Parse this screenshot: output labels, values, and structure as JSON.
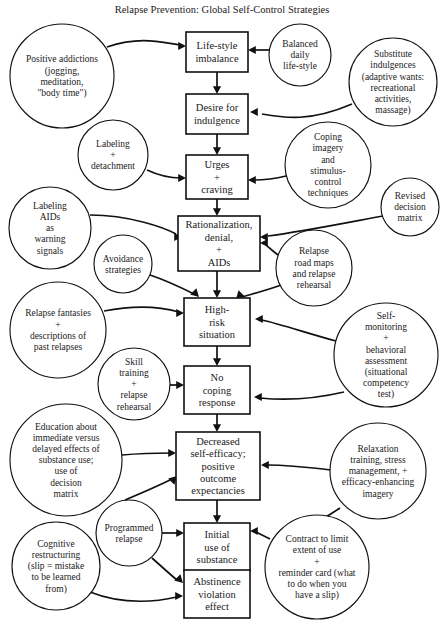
{
  "title": "Relapse Prevention: Global Self-Control Strategies",
  "diagram": {
    "type": "flowchart",
    "canvas": {
      "width": 440,
      "height": 624
    },
    "title_position": {
      "x": 222,
      "y": 13
    },
    "boxes": [
      {
        "id": "lifestyle-imbalance",
        "x": 186,
        "y": 32,
        "w": 62,
        "h": 40,
        "lines": [
          "Life-style",
          "imbalance"
        ],
        "font_size": 10.5
      },
      {
        "id": "desire-for-indulgence",
        "x": 186,
        "y": 94,
        "w": 62,
        "h": 40,
        "lines": [
          "Desire for",
          "indulgence"
        ],
        "font_size": 10.5
      },
      {
        "id": "urges-craving",
        "x": 186,
        "y": 155,
        "w": 62,
        "h": 44,
        "lines": [
          "Urges",
          "+",
          "craving"
        ],
        "font_size": 10.5
      },
      {
        "id": "rationalization-denial-aids",
        "x": 178,
        "y": 216,
        "w": 82,
        "h": 55,
        "lines": [
          "Rationalization,",
          "denial,",
          "+",
          "AIDs"
        ],
        "font_size": 10.5
      },
      {
        "id": "high-risk-situation",
        "x": 184,
        "y": 298,
        "w": 66,
        "h": 48,
        "lines": [
          "High-",
          "risk",
          "situation"
        ],
        "font_size": 10.5
      },
      {
        "id": "no-coping-response",
        "x": 184,
        "y": 366,
        "w": 66,
        "h": 48,
        "lines": [
          "No",
          "coping",
          "response"
        ],
        "font_size": 10.5
      },
      {
        "id": "decreased-self-efficacy",
        "x": 176,
        "y": 432,
        "w": 84,
        "h": 68,
        "lines": [
          "Decreased",
          "self-efficacy;",
          "positive",
          "outcome",
          "expectancies"
        ],
        "font_size": 10.5
      },
      {
        "id": "initial-use-of-substance",
        "x": 184,
        "y": 523,
        "w": 66,
        "h": 48,
        "lines": [
          "Initial",
          "use of",
          "substance"
        ],
        "font_size": 10.5
      },
      {
        "id": "abstinence-violation-effect",
        "x": 184,
        "y": 570,
        "w": 66,
        "h": 48,
        "lines": [
          "Abstinence",
          "violation",
          "effect"
        ],
        "font_size": 10.5
      }
    ],
    "circles": [
      {
        "id": "positive-addictions",
        "cx": 62,
        "cy": 76,
        "r": 52,
        "lines": [
          "Positive addictions",
          "(jogging,",
          "meditation,",
          "\"body time\")"
        ],
        "font_size": 9.5
      },
      {
        "id": "balanced-daily-lifestyle",
        "cx": 300,
        "cy": 55,
        "r": 31,
        "lines": [
          "Balanced",
          "daily",
          "life-style"
        ],
        "font_size": 9.5
      },
      {
        "id": "substitute-indulgences",
        "cx": 393,
        "cy": 82,
        "r": 44,
        "lines": [
          "Substitute",
          "indulgences",
          "(adaptive wants:",
          "recreational",
          "activities,",
          "massage)"
        ],
        "font_size": 9.5
      },
      {
        "id": "labeling-detachment",
        "cx": 113,
        "cy": 155,
        "r": 35,
        "lines": [
          "Labeling",
          "+",
          "detachment"
        ],
        "font_size": 9.5
      },
      {
        "id": "coping-imagery",
        "cx": 328,
        "cy": 165,
        "r": 43,
        "lines": [
          "Coping",
          "imagery",
          "and",
          "stimulus-",
          "control",
          "techniques"
        ],
        "font_size": 9.5
      },
      {
        "id": "revised-decision-matrix",
        "cx": 410,
        "cy": 207,
        "r": 29,
        "lines": [
          "Revised",
          "decision",
          "matrix"
        ],
        "font_size": 9.5
      },
      {
        "id": "labeling-aids-warning-signals",
        "cx": 50,
        "cy": 228,
        "r": 41,
        "lines": [
          "Labeling",
          "AIDs",
          "as",
          "warning",
          "signals"
        ],
        "font_size": 9.5
      },
      {
        "id": "avoidance-strategies",
        "cx": 123,
        "cy": 264,
        "r": 29,
        "lines": [
          "Avoidance",
          "strategies"
        ],
        "font_size": 9.5
      },
      {
        "id": "relapse-road-maps",
        "cx": 314,
        "cy": 268,
        "r": 38,
        "lines": [
          "Relapse",
          "road maps",
          "and relapse",
          "rehearsal"
        ],
        "font_size": 9.5
      },
      {
        "id": "relapse-fantasies",
        "cx": 58,
        "cy": 330,
        "r": 48,
        "lines": [
          "Relapse fantasies",
          "+",
          "descriptions of",
          "past relapses"
        ],
        "font_size": 9.5
      },
      {
        "id": "skill-training-relapse-rehearsal",
        "cx": 134,
        "cy": 384,
        "r": 36,
        "lines": [
          "Skill",
          "training",
          "+",
          "relapse",
          "rehearsal"
        ],
        "font_size": 9.5
      },
      {
        "id": "self-monitoring",
        "cx": 386,
        "cy": 355,
        "r": 52,
        "lines": [
          "Self-",
          "monitoring",
          "+",
          "behavioral",
          "assessment",
          "(situational",
          "competency",
          "test)"
        ],
        "font_size": 9.5
      },
      {
        "id": "education-immediate-delayed",
        "cx": 66,
        "cy": 460,
        "r": 56,
        "lines": [
          "Education about",
          "immediate versus",
          "delayed effects of",
          "substance use;",
          "use of",
          "decision",
          "matrix"
        ],
        "font_size": 9.5
      },
      {
        "id": "relaxation-training",
        "cx": 378,
        "cy": 471,
        "r": 48,
        "lines": [
          "Relaxation",
          "training, stress",
          "management, +",
          "efficacy-enhancing",
          "imagery"
        ],
        "font_size": 9.5
      },
      {
        "id": "programmed-relapse",
        "cx": 129,
        "cy": 533,
        "r": 33,
        "lines": [
          "Programmed",
          "relapse"
        ],
        "font_size": 9.5
      },
      {
        "id": "cognitive-restructuring",
        "cx": 56,
        "cy": 566,
        "r": 44,
        "lines": [
          "Cognitive",
          "restructuring",
          "(slip = mistake",
          "to be learned",
          "from)"
        ],
        "font_size": 9.5
      },
      {
        "id": "contract-to-limit",
        "cx": 317,
        "cy": 567,
        "r": 52,
        "lines": [
          "Contract to limit",
          "extent of use",
          "+",
          "reminder card (what",
          "to do when you",
          "have a slip)"
        ],
        "font_size": 9.5
      }
    ],
    "edges": [
      {
        "id": "e-lifestyle-to-desire",
        "from": "lifestyle-imbalance",
        "to": "desire-for-indulgence",
        "d": "M 217 72 L 217 90",
        "arrow": {
          "x": 217,
          "y": 94,
          "dir": "down"
        }
      },
      {
        "id": "e-desire-to-urges",
        "from": "desire-for-indulgence",
        "to": "urges-craving",
        "d": "M 217 134 L 217 151",
        "arrow": {
          "x": 217,
          "y": 155,
          "dir": "down"
        }
      },
      {
        "id": "e-urges-to-rationalization",
        "from": "urges-craving",
        "to": "rationalization-denial-aids",
        "d": "M 217 199 L 217 212",
        "arrow": {
          "x": 217,
          "y": 216,
          "dir": "down"
        }
      },
      {
        "id": "e-rationalization-to-highrisk",
        "from": "rationalization-denial-aids",
        "to": "high-risk-situation",
        "d": "M 217 271 L 217 294",
        "arrow": {
          "x": 217,
          "y": 298,
          "dir": "down"
        }
      },
      {
        "id": "e-highrisk-to-nocoping",
        "from": "high-risk-situation",
        "to": "no-coping-response",
        "d": "M 217 346 L 217 362",
        "arrow": {
          "x": 217,
          "y": 366,
          "dir": "down"
        }
      },
      {
        "id": "e-nocoping-to-decreased",
        "from": "no-coping-response",
        "to": "decreased-self-efficacy",
        "d": "M 217 414 L 217 428",
        "arrow": {
          "x": 217,
          "y": 432,
          "dir": "down"
        }
      },
      {
        "id": "e-decreased-to-initial",
        "from": "decreased-self-efficacy",
        "to": "initial-use-of-substance",
        "d": "M 217 500 L 217 519",
        "arrow": {
          "x": 217,
          "y": 523,
          "dir": "down"
        }
      },
      {
        "id": "e-initial-to-abstinence",
        "from": "initial-use-of-substance",
        "to": "abstinence-violation-effect",
        "d": "M 217 556 L 217 566",
        "arrow": {
          "x": 217,
          "y": 570,
          "dir": "down"
        }
      },
      {
        "id": "e-positive-addictions-to-lifestyle",
        "from": "positive-addictions",
        "to": "lifestyle-imbalance",
        "d": "M 107 47 C 140 36 160 42 180 45",
        "arrow": {
          "x": 186,
          "y": 46,
          "dir": "right"
        }
      },
      {
        "id": "e-balanced-to-lifestyle",
        "from": "balanced-daily-lifestyle",
        "to": "lifestyle-imbalance",
        "d": "M 270 50 L 254 50",
        "arrow": {
          "x": 248,
          "y": 50,
          "dir": "left"
        }
      },
      {
        "id": "e-substitute-to-desire",
        "from": "substitute-indulgences",
        "to": "desire-for-indulgence",
        "d": "M 352 104 C 310 122 285 118 262 114",
        "arrow": {
          "x": 250,
          "y": 112,
          "dir": "left"
        }
      },
      {
        "id": "e-labeling-detachment-to-urges",
        "from": "labeling-detachment",
        "to": "urges-craving",
        "d": "M 147 170 C 162 177 172 178 181 178",
        "arrow": {
          "x": 186,
          "y": 178,
          "dir": "right"
        }
      },
      {
        "id": "e-coping-imagery-to-urges",
        "from": "coping-imagery",
        "to": "urges-craving",
        "d": "M 286 176 C 270 180 262 180 254 180",
        "arrow": {
          "x": 248,
          "y": 180,
          "dir": "left"
        }
      },
      {
        "id": "e-revised-matrix-to-rationalization",
        "from": "revised-decision-matrix",
        "to": "rationalization-denial-aids",
        "d": "M 383 216 C 340 224 300 232 268 236",
        "arrow": {
          "x": 260,
          "y": 237,
          "dir": "left"
        }
      },
      {
        "id": "e-labeling-aids-to-rationalization",
        "from": "labeling-aids-warning-signals",
        "to": "rationalization-denial-aids",
        "d": "M 90 215 C 130 215 165 228 176 234",
        "arrow": {
          "x": 182,
          "y": 237,
          "dir": "right"
        }
      },
      {
        "id": "e-avoidance-to-highrisk",
        "from": "avoidance-strategies",
        "to": "high-risk-situation",
        "d": "M 150 275 C 168 281 182 288 194 294",
        "arrow": {
          "x": 199,
          "y": 297,
          "dir": "down-right"
        }
      },
      {
        "id": "e-relapse-roadmaps-to-rationalization",
        "from": "relapse-road-maps",
        "to": "rationalization-denial-aids",
        "d": "M 278 255 C 272 250 266 246 266 244",
        "arrow": {
          "x": 260,
          "y": 243,
          "dir": "left"
        }
      },
      {
        "id": "e-relapse-roadmaps-to-highrisk",
        "from": "relapse-road-maps",
        "to": "high-risk-situation",
        "d": "M 284 284 C 268 290 252 294 242 297",
        "arrow": {
          "x": 236,
          "y": 299,
          "dir": "down-left"
        }
      },
      {
        "id": "e-relapse-fantasies-to-highrisk",
        "from": "relapse-fantasies",
        "to": "high-risk-situation",
        "d": "M 104 311 C 140 304 165 308 179 312",
        "arrow": {
          "x": 184,
          "y": 313,
          "dir": "right"
        }
      },
      {
        "id": "e-self-monitoring-to-highrisk",
        "from": "self-monitoring",
        "to": "high-risk-situation",
        "d": "M 336 341 C 310 334 280 324 262 320",
        "arrow": {
          "x": 255,
          "y": 319,
          "dir": "left"
        }
      },
      {
        "id": "e-skill-training-to-nocoping",
        "from": "skill-training-relapse-rehearsal",
        "to": "no-coping-response",
        "d": "M 170 385 L 179 385",
        "arrow": {
          "x": 184,
          "y": 385,
          "dir": "right"
        }
      },
      {
        "id": "e-self-monitoring-to-nocoping",
        "from": "self-monitoring",
        "to": "no-coping-response",
        "d": "M 344 392 C 310 400 280 400 260 398",
        "arrow": {
          "x": 254,
          "y": 397,
          "dir": "left"
        }
      },
      {
        "id": "e-education-to-decreased",
        "from": "education-immediate-delayed",
        "to": "decreased-self-efficacy",
        "d": "M 122 455 C 145 453 160 453 171 453",
        "arrow": {
          "x": 176,
          "y": 453,
          "dir": "right"
        }
      },
      {
        "id": "e-relaxation-to-decreased",
        "from": "relaxation-training",
        "to": "decreased-self-efficacy",
        "d": "M 331 470 C 305 467 285 465 268 465",
        "arrow": {
          "x": 261,
          "y": 465,
          "dir": "left"
        }
      },
      {
        "id": "e-programmed-relapse-to-decreased",
        "from": "programmed-relapse",
        "to": "decreased-self-efficacy",
        "d": "M 125 500 C 144 492 160 485 172 479",
        "arrow": {
          "x": 177,
          "y": 476,
          "dir": "up-right"
        }
      },
      {
        "id": "e-programmed-relapse-to-initial",
        "from": "programmed-relapse",
        "to": "initial-use-of-substance",
        "d": "M 162 533 L 179 533",
        "arrow": {
          "x": 184,
          "y": 533,
          "dir": "right"
        }
      },
      {
        "id": "e-contract-to-initial",
        "from": "contract-to-limit",
        "to": "initial-use-of-substance",
        "d": "M 270 539 C 262 535 258 533 256 532",
        "arrow": {
          "x": 250,
          "y": 531,
          "dir": "left"
        }
      },
      {
        "id": "e-programmed-relapse-to-abstinence",
        "from": "programmed-relapse",
        "to": "abstinence-violation-effect",
        "d": "M 152 558 C 162 567 172 576 177 580",
        "arrow": {
          "x": 183,
          "y": 583,
          "dir": "down-right"
        }
      },
      {
        "id": "e-cognitive-to-abstinence",
        "from": "cognitive-restructuring",
        "to": "abstinence-violation-effect",
        "d": "M 90 592 C 125 606 160 601 177 597",
        "arrow": {
          "x": 183,
          "y": 596,
          "dir": "right"
        }
      },
      {
        "id": "e-relaxation-to-contract",
        "from": "relaxation-training",
        "to": "contract-to-limit",
        "d": "M 340 508 C 330 515 322 519 318 521",
        "arrow": null
      }
    ]
  }
}
